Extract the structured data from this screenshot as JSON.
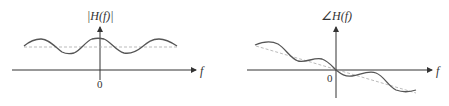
{
  "left_plot": {
    "title": "|H(f)|",
    "x_label": "f",
    "origin_label": "0",
    "curve": "cosine ripple around constant level",
    "reference": "dashed constant line"
  },
  "right_plot": {
    "title": "∠H(f)",
    "x_label": "f",
    "origin_label": "0",
    "curve": "linear phase with sinusoidal ripple",
    "reference": "dashed linear phase line"
  },
  "colors": {
    "axis": "#333333",
    "curve": "#555555",
    "dashed": "#aaaaaa"
  }
}
